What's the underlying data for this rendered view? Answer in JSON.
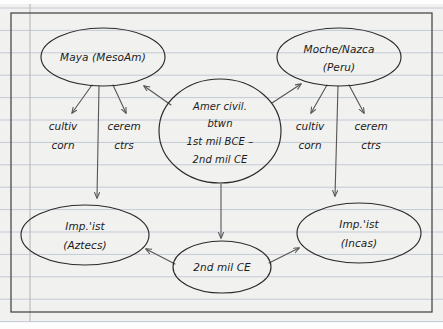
{
  "page": {
    "kind": "handwritten-concept-map",
    "surface": "ruled-notebook-paper",
    "width": 443,
    "height": 329
  },
  "colors": {
    "paper": "#f1f1ef",
    "rule_line": "#c3cad4",
    "margin_line": "#b9b4c0",
    "border": "#4a4a4a",
    "ink": "#1b1b1b",
    "arrow": "#555557"
  },
  "nodes": [
    {
      "id": "maya",
      "shape": "ellipse",
      "lines": [
        "Maya (MesoAm)"
      ],
      "cx": 103,
      "cy": 57,
      "rx": 62,
      "ry": 29
    },
    {
      "id": "moche",
      "shape": "ellipse",
      "lines": [
        "Moche/Nazca",
        "(Peru)"
      ],
      "cx": 339,
      "cy": 57,
      "rx": 62,
      "ry": 29
    },
    {
      "id": "amer-civil",
      "shape": "circle",
      "lines": [
        "Amer civil.",
        "btwn",
        "1st mil BCE –",
        "2nd mil CE"
      ],
      "cx": 220,
      "cy": 131,
      "rx": 61,
      "ry": 52
    },
    {
      "id": "aztecs",
      "shape": "ellipse",
      "lines": [
        "Imp.'ist",
        "(Aztecs)"
      ],
      "cx": 85,
      "cy": 235,
      "rx": 64,
      "ry": 30
    },
    {
      "id": "incas",
      "shape": "ellipse",
      "lines": [
        "Imp.'ist",
        "(Incas)"
      ],
      "cx": 359,
      "cy": 233,
      "rx": 62,
      "ry": 30
    },
    {
      "id": "second-mil",
      "shape": "ellipse",
      "lines": [
        "2nd mil CE"
      ],
      "cx": 222,
      "cy": 267,
      "rx": 49,
      "ry": 26
    }
  ],
  "labels": [
    {
      "id": "cultiv-corn-left",
      "lines": [
        "cultiv",
        "corn"
      ],
      "cx": 63,
      "cy": 132
    },
    {
      "id": "cerem-ctrs-left",
      "lines": [
        "cerem",
        "ctrs"
      ],
      "cx": 124,
      "cy": 132
    },
    {
      "id": "cultiv-corn-right",
      "lines": [
        "cultiv",
        "corn"
      ],
      "cx": 310,
      "cy": 132
    },
    {
      "id": "cerem-ctrs-right",
      "lines": [
        "cerem",
        "ctrs"
      ],
      "cx": 371,
      "cy": 132
    }
  ],
  "connectors": [
    {
      "id": "maya-to-cultiv-corn",
      "from": "maya",
      "to": "cultiv-corn-left",
      "arrow": true
    },
    {
      "id": "maya-to-cerem-ctrs",
      "from": "maya",
      "to": "cerem-ctrs-left",
      "arrow": true
    },
    {
      "id": "maya-to-aztecs",
      "from": "maya",
      "to": "aztecs",
      "arrow": true
    },
    {
      "id": "amer-civil-to-maya",
      "from": "amer-civil",
      "to": "maya",
      "arrow": true
    },
    {
      "id": "amer-civil-to-moche",
      "from": "amer-civil",
      "to": "moche",
      "arrow": true
    },
    {
      "id": "amer-civil-to-second-mil",
      "from": "amer-civil",
      "to": "second-mil",
      "arrow": true
    },
    {
      "id": "moche-to-cultiv-corn",
      "from": "moche",
      "to": "cultiv-corn-right",
      "arrow": true
    },
    {
      "id": "moche-to-cerem-ctrs",
      "from": "moche",
      "to": "cerem-ctrs-right",
      "arrow": true
    },
    {
      "id": "moche-to-incas",
      "from": "moche",
      "to": "incas",
      "arrow": true
    },
    {
      "id": "second-mil-to-aztecs",
      "from": "second-mil",
      "to": "aztecs",
      "arrow": true
    },
    {
      "id": "second-mil-to-incas",
      "from": "second-mil",
      "to": "incas",
      "arrow": true
    }
  ],
  "paper": {
    "border_rect": {
      "x": 11,
      "y": 13,
      "width": 421,
      "height": 299
    },
    "margin_line_x": 30,
    "rule_line_spacing": 22.4,
    "rule_line_first_y": 8
  }
}
